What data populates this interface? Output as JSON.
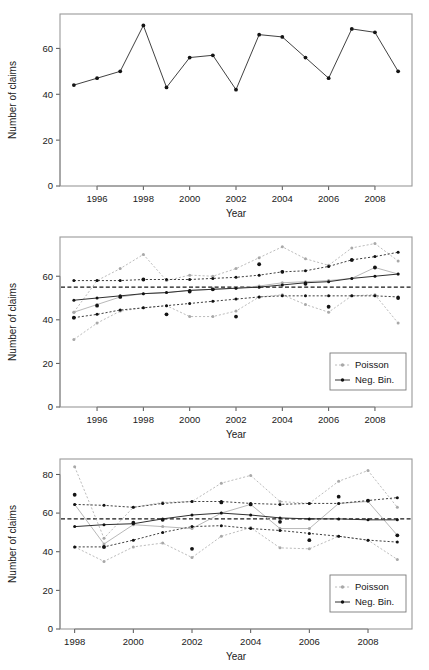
{
  "figure": {
    "panel_count": 3,
    "shared_xlabel": "Year",
    "shared_ylabel": "Number of claims",
    "legend_labels": {
      "poisson": "Poisson",
      "negbin": "Neg. Bin."
    },
    "colors": {
      "poisson": "#b0b0b0",
      "negbin": "#202020",
      "observed": "#141414",
      "frame": "#9a9a9a"
    }
  },
  "chart_data": [
    {
      "id": "panel-1",
      "type": "line",
      "title": "",
      "xlabel": "Year",
      "ylabel": "Number of claims",
      "xlim": [
        1994.4,
        2009.6
      ],
      "ylim": [
        0,
        75
      ],
      "yticks": [
        0,
        20,
        40,
        60
      ],
      "xticks": [
        1996,
        1998,
        2000,
        2002,
        2004,
        2006,
        2008
      ],
      "grid": false,
      "legend": "none",
      "x": [
        1995,
        1996,
        1997,
        1998,
        1999,
        2000,
        2001,
        2002,
        2003,
        2004,
        2005,
        2006,
        2007,
        2008,
        2009
      ],
      "series": [
        {
          "name": "Observed number of claims",
          "marker": "filled-circle",
          "linestyle": "solid",
          "color": "#141414",
          "values": [
            44,
            47,
            50,
            70,
            43,
            56,
            57,
            42,
            66,
            65,
            56,
            47,
            68.5,
            67,
            50
          ]
        }
      ]
    },
    {
      "id": "panel-2",
      "type": "line",
      "title": "",
      "xlabel": "Year",
      "ylabel": "Number of claims",
      "xlim": [
        1994.4,
        2009.6
      ],
      "ylim": [
        0,
        78
      ],
      "yticks": [
        0,
        20,
        40,
        60
      ],
      "xticks": [
        1996,
        1998,
        2000,
        2002,
        2004,
        2006,
        2008
      ],
      "grid": false,
      "legend": "bottom-right",
      "reference_line": {
        "value": 55,
        "linestyle": "dashed",
        "color": "#181818"
      },
      "x": [
        1995,
        1996,
        1997,
        1998,
        1999,
        2000,
        2001,
        2002,
        2003,
        2004,
        2005,
        2006,
        2007,
        2008,
        2009
      ],
      "series": [
        {
          "name": "Poisson upper limit",
          "group": "Poisson",
          "linestyle": "dotted",
          "color": "#b0b0b0",
          "values": [
            43.5,
            58,
            63.5,
            70,
            58,
            60.5,
            60,
            63.5,
            68.5,
            73.5,
            68,
            65,
            73,
            75,
            67
          ]
        },
        {
          "name": "Poisson fitted",
          "group": "Poisson",
          "linestyle": "solid",
          "color": "#b0b0b0",
          "values": [
            43.5,
            47,
            50.5,
            52,
            52.5,
            53.5,
            54,
            54.5,
            55.5,
            57,
            57.5,
            58,
            59,
            64,
            61
          ]
        },
        {
          "name": "Poisson lower limit",
          "group": "Poisson",
          "linestyle": "dotted",
          "color": "#b0b0b0",
          "values": [
            31,
            38.5,
            44,
            45.5,
            46.5,
            41.5,
            41.5,
            44,
            50.5,
            51.5,
            47,
            43.5,
            51,
            51.5,
            38.5
          ]
        },
        {
          "name": "Neg. Bin. upper limit",
          "group": "Neg. Bin.",
          "linestyle": "dashed",
          "color": "#202020",
          "values": [
            58,
            58,
            58,
            58.5,
            58.5,
            58.5,
            59,
            59.5,
            60.5,
            62,
            62.5,
            64.5,
            67.5,
            69,
            71
          ]
        },
        {
          "name": "Neg. Bin. fitted",
          "group": "Neg. Bin.",
          "linestyle": "solid",
          "color": "#202020",
          "values": [
            49,
            50,
            51,
            52,
            52.5,
            53.5,
            54,
            54.5,
            55,
            56,
            57,
            57.5,
            59,
            60,
            61
          ]
        },
        {
          "name": "Neg. Bin. lower limit",
          "group": "Neg. Bin.",
          "linestyle": "dashed",
          "color": "#202020",
          "values": [
            41,
            42.5,
            44.5,
            45.5,
            46.5,
            47.5,
            48.5,
            49.5,
            50.5,
            51,
            51,
            51,
            51,
            51,
            50.5
          ]
        },
        {
          "name": "Observed",
          "group": "Observed",
          "linestyle": "none",
          "marker": "filled-circle",
          "color": "#141414",
          "values": [
            41,
            46.5,
            50.5,
            58.5,
            42.5,
            53,
            54,
            41.5,
            65.5,
            62,
            56.5,
            46,
            67.5,
            64,
            50
          ]
        }
      ]
    },
    {
      "id": "panel-3",
      "type": "line",
      "title": "",
      "xlabel": "Year",
      "ylabel": "Number of claims",
      "xlim": [
        1997.5,
        2009.5
      ],
      "ylim": [
        0,
        88
      ],
      "yticks": [
        0,
        20,
        40,
        60,
        80
      ],
      "xticks": [
        1998,
        2000,
        2002,
        2004,
        2006,
        2008
      ],
      "grid": false,
      "legend": "bottom-right",
      "reference_line": {
        "value": 57,
        "linestyle": "dashed",
        "color": "#181818"
      },
      "x": [
        1998,
        1999,
        2000,
        2001,
        2002,
        2003,
        2004,
        2005,
        2006,
        2007,
        2008,
        2009
      ],
      "series": [
        {
          "name": "Poisson upper limit",
          "group": "Poisson",
          "linestyle": "dotted",
          "color": "#b0b0b0",
          "values": [
            84,
            47,
            63,
            65.5,
            66,
            75.5,
            79.5,
            66,
            65,
            76.5,
            82,
            63
          ]
        },
        {
          "name": "Poisson fitted",
          "group": "Poisson",
          "linestyle": "solid",
          "color": "#b0b0b0",
          "values": [
            64.5,
            44,
            54,
            53,
            52,
            60,
            64.5,
            52,
            52,
            65,
            66,
            48.5
          ]
        },
        {
          "name": "Poisson lower limit",
          "group": "Poisson",
          "linestyle": "dotted",
          "color": "#b0b0b0",
          "values": [
            42.5,
            35,
            42.5,
            44.5,
            37,
            48,
            52.5,
            42,
            41.5,
            48,
            46,
            36
          ]
        },
        {
          "name": "Neg. Bin. upper limit",
          "group": "Neg. Bin.",
          "linestyle": "dashed",
          "color": "#202020",
          "values": [
            64.5,
            64,
            63,
            65,
            66,
            66,
            65,
            64.5,
            65,
            65,
            66.5,
            68
          ]
        },
        {
          "name": "Neg. Bin. fitted",
          "group": "Neg. Bin.",
          "linestyle": "solid",
          "color": "#202020",
          "values": [
            53,
            54,
            54.5,
            57,
            59,
            60,
            59,
            57.5,
            57,
            57,
            56.5,
            56.5
          ]
        },
        {
          "name": "Neg. Bin. lower limit",
          "group": "Neg. Bin.",
          "linestyle": "dashed",
          "color": "#202020",
          "values": [
            42.5,
            42.5,
            46,
            50,
            53,
            53.5,
            52,
            51,
            49.5,
            48,
            46,
            45
          ]
        },
        {
          "name": "Observed",
          "group": "Observed",
          "linestyle": "none",
          "marker": "filled-circle",
          "color": "#141414",
          "values": [
            69.5,
            42.5,
            55,
            56.5,
            41.5,
            65.5,
            64.5,
            55.5,
            46,
            68.5,
            66.5,
            48.5
          ]
        }
      ]
    }
  ]
}
